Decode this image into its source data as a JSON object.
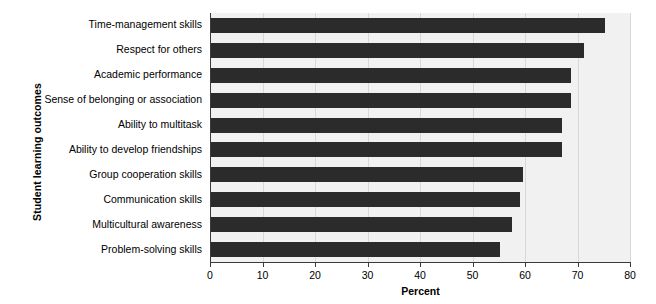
{
  "chart_data": {
    "type": "bar",
    "orientation": "horizontal",
    "title": "",
    "xlabel": "Percent",
    "ylabel": "Student learning outcomes",
    "categories": [
      "Time-management skills",
      "Respect for others",
      "Academic performance",
      "Sense of belonging or association",
      "Ability to multitask",
      "Ability to develop friendships",
      "Group cooperation skills",
      "Communication skills",
      "Multicultural awareness",
      "Problem-solving skills"
    ],
    "values": [
      75.2,
      71.2,
      68.8,
      68.8,
      67.0,
      67.0,
      59.6,
      59.0,
      57.5,
      55.2
    ],
    "xlim": [
      0,
      80
    ],
    "xticks": [
      0,
      10,
      20,
      30,
      40,
      50,
      60,
      70,
      80
    ],
    "xtick_labels": [
      "0",
      "10",
      "20",
      "30",
      "40",
      "50",
      "60",
      "70",
      "80"
    ],
    "grid": "vertical-light",
    "legend": "none",
    "bar_color": "#2b2b2b",
    "plot_background": "#f1f1f1",
    "axis_color": "#3a3a3a"
  }
}
